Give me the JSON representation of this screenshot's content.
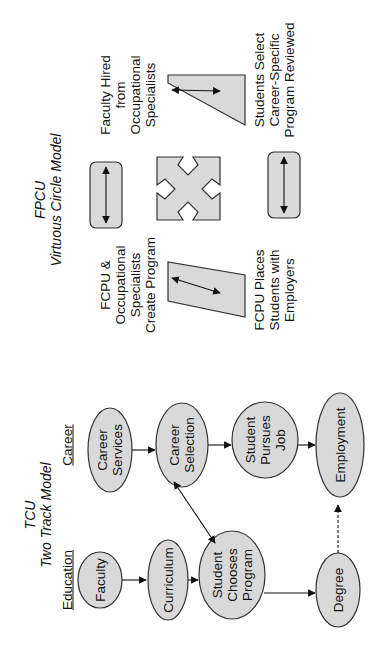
{
  "fpcu": {
    "title": "FPCU",
    "subtitle": "Virtuous Circle Model",
    "labels": {
      "faculty_hired": [
        "Faculty Hired",
        "from",
        "Occupational",
        "Specialists"
      ],
      "students_select": [
        "Students Select",
        "Career-Specific",
        "Program Reviewed"
      ],
      "fcpu_create": [
        "FCPU &",
        "Occupational",
        "Specialists",
        "Create Program"
      ],
      "fcpu_places": [
        "FCPU Places",
        "Students  with",
        "Employers"
      ]
    }
  },
  "tcu": {
    "title": "TCU",
    "subtitle": "Two Track Model",
    "tracks": {
      "education": "Education",
      "career": "Career"
    },
    "nodes": {
      "faculty": [
        "Faculty"
      ],
      "curriculum": [
        "Curriculum"
      ],
      "student_chooses": [
        "Student",
        "Chooses",
        "Program"
      ],
      "degree": [
        "Degree"
      ],
      "career_services": [
        "Career",
        "Services"
      ],
      "career_selection": [
        "Career",
        "Selection"
      ],
      "student_pursues": [
        "Student",
        "Pursues",
        "Job"
      ],
      "employment": [
        "Employment"
      ]
    }
  },
  "colors": {
    "fill": "#d9d9d9",
    "stroke": "#333333",
    "text": "#111111"
  }
}
